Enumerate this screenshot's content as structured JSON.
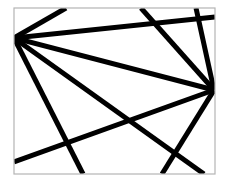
{
  "diagram": {
    "width": 228,
    "height": 184,
    "background": "#ffffff",
    "frame": {
      "x": 14,
      "y": 8,
      "width": 201,
      "height": 166,
      "stroke": "#b4b4b4",
      "stroke_width": 1.2
    },
    "line_color": "#000000",
    "line_width": 5,
    "hubs": [
      {
        "name": "left-hub",
        "x": 14,
        "y": 38
      },
      {
        "name": "right-hub",
        "x": 214,
        "y": 90
      }
    ],
    "lines": [
      {
        "x1": 14,
        "y1": 38,
        "x2": 66,
        "y2": 8
      },
      {
        "x1": 14,
        "y1": 38,
        "x2": 215,
        "y2": 17
      },
      {
        "x1": 14,
        "y1": 38,
        "x2": 214,
        "y2": 90
      },
      {
        "x1": 14,
        "y1": 38,
        "x2": 83,
        "y2": 174
      },
      {
        "x1": 14,
        "y1": 38,
        "x2": 204,
        "y2": 174
      },
      {
        "x1": 141,
        "y1": 8,
        "x2": 214,
        "y2": 90
      },
      {
        "x1": 196,
        "y1": 8,
        "x2": 214,
        "y2": 90
      },
      {
        "x1": 14,
        "y1": 162,
        "x2": 214,
        "y2": 90
      },
      {
        "x1": 214,
        "y1": 90,
        "x2": 162,
        "y2": 174
      }
    ]
  }
}
